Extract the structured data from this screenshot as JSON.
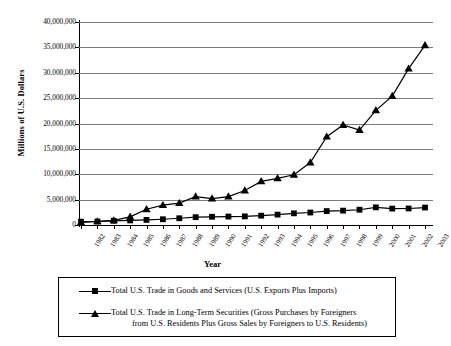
{
  "chart_data": {
    "type": "line",
    "title": "",
    "xlabel": "Year",
    "ylabel": "Millions of U.S. Dollars",
    "grid": true,
    "legend_position": "bottom",
    "ylim": [
      0,
      40000000
    ],
    "ytick_labels": [
      "40,000,000",
      "35,000,000",
      "30,000,000",
      "25,000,000",
      "20,000,000",
      "15,000,000",
      "10,000,000",
      "5,000,000",
      "0"
    ],
    "ytick_values": [
      40000000,
      35000000,
      30000000,
      25000000,
      20000000,
      15000000,
      10000000,
      5000000,
      0
    ],
    "categories": [
      "1982",
      "1983",
      "1984",
      "1985",
      "1986",
      "1987",
      "1988",
      "1989",
      "1990",
      "1991",
      "1992",
      "1993",
      "1994",
      "1995",
      "1996",
      "1997",
      "1998",
      "1999",
      "2000",
      "2001",
      "2002",
      "2003"
    ],
    "series": [
      {
        "name": "Total U.S. Trade in Goods and Services (U.S. Exports Plus Imports)",
        "marker": "square",
        "values": [
          650000,
          690000,
          830000,
          900000,
          1000000,
          1130000,
          1330000,
          1540000,
          1620000,
          1660000,
          1700000,
          1840000,
          2050000,
          2300000,
          2460000,
          2740000,
          2830000,
          3010000,
          3480000,
          3230000,
          3250000,
          3440000
        ]
      },
      {
        "name": "Total U.S. Trade in Long-Term Securities (Gross Purchases by Foreigners from U.S. Residents Plus Gross Sales by Foreigners to U.S. Residents)",
        "marker": "triangle",
        "values": [
          500000,
          700000,
          900000,
          1600000,
          3100000,
          3900000,
          4300000,
          5600000,
          5200000,
          5600000,
          6800000,
          8600000,
          9200000,
          9900000,
          12300000,
          17400000,
          19700000,
          18700000,
          22600000,
          25400000,
          30800000,
          35400000
        ]
      }
    ]
  },
  "legend": {
    "entry1": "Total U.S. Trade in Goods and Services (U.S. Exports Plus Imports)",
    "entry2_line1": "Total U.S. Trade in Long-Term Securities (Gross Purchases by Foreigners",
    "entry2_line2": "from U.S. Residents Plus Gross Sales by Foreigners to U.S. Residents)"
  },
  "colors": {
    "series": "#000000",
    "gridline": "#7c7c7c",
    "axis": "#000000",
    "background": "#ffffff"
  }
}
